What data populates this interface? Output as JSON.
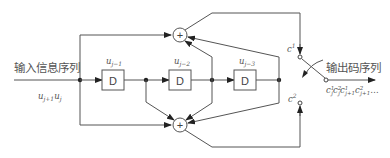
{
  "diagram": {
    "input_label": "输入信息序列",
    "input_sequence": "u",
    "input_sequence_sub": "j+1",
    "input_sequence2": "u",
    "input_sequence2_sub": "j",
    "output_label": "输出码序列",
    "output_sequence": "c",
    "output_sequence_parts": [
      {
        "base": "c",
        "sup": "1",
        "sub": "j"
      },
      {
        "base": "c",
        "sup": "2",
        "sub": "j"
      },
      {
        "base": "c",
        "sup": "1",
        "sub": "j+1"
      },
      {
        "base": "c",
        "sup": "2",
        "sub": "j+1"
      }
    ],
    "output_ellipsis": "…",
    "delays": [
      {
        "label": "D",
        "state": "u",
        "state_sub": "j−1"
      },
      {
        "label": "D",
        "state": "u",
        "state_sub": "j−2"
      },
      {
        "label": "D",
        "state": "u",
        "state_sub": "j−3"
      }
    ],
    "adder_symbol": "+",
    "switch_contacts": [
      {
        "base": "c",
        "sup": "1"
      },
      {
        "base": "c",
        "sup": "2"
      }
    ]
  }
}
